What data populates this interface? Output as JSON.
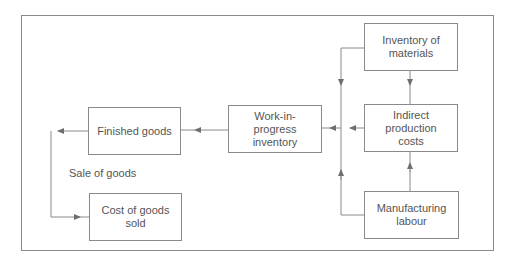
{
  "diagram": {
    "nodes": {
      "inventory_of_materials": "Inventory of\nmaterials",
      "indirect_production_costs": "Indirect\nproduction\ncosts",
      "manufacturing_labour": "Manufacturing\nlabour",
      "work_in_progress": "Work-in-\nprogress\ninventory",
      "finished_goods": "Finished goods",
      "cost_of_goods_sold": "Cost of goods\nsold"
    },
    "edge_labels": {
      "sale_of_goods": "Sale of goods"
    },
    "edges": [
      {
        "from": "inventory_of_materials",
        "to": "indirect_production_costs"
      },
      {
        "from": "manufacturing_labour",
        "to": "indirect_production_costs"
      },
      {
        "from": "inventory_of_materials",
        "to": "work_in_progress"
      },
      {
        "from": "manufacturing_labour",
        "to": "work_in_progress"
      },
      {
        "from": "indirect_production_costs",
        "to": "work_in_progress"
      },
      {
        "from": "work_in_progress",
        "to": "finished_goods"
      },
      {
        "from": "finished_goods",
        "to": "cost_of_goods_sold",
        "label": "Sale of goods"
      }
    ],
    "colors": {
      "line": "#8a8a8a",
      "text": "#555555"
    }
  }
}
